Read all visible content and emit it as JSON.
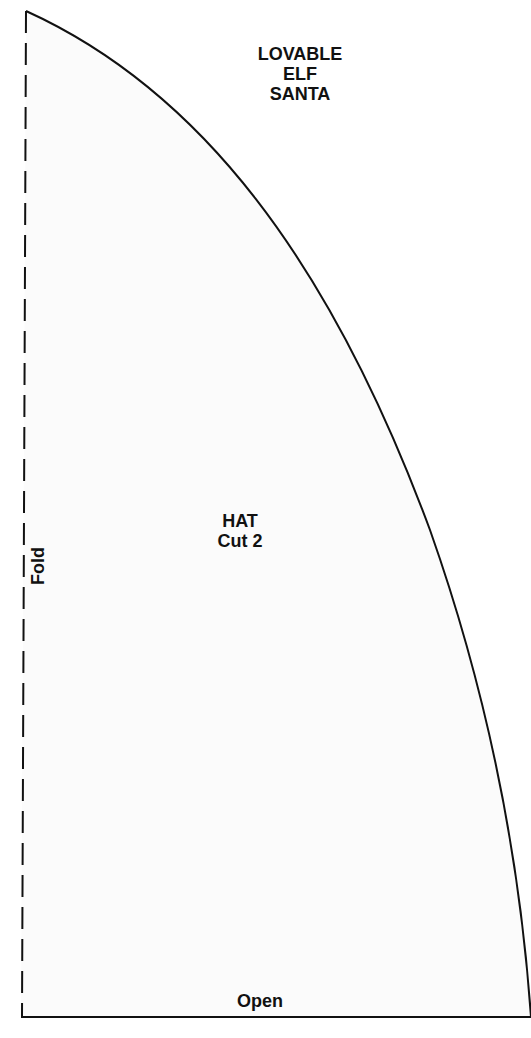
{
  "pattern": {
    "title_lines": [
      "LOVABLE",
      "ELF",
      "SANTA"
    ],
    "piece": {
      "name": "HAT",
      "instruction": "Cut 2"
    },
    "edges": {
      "fold_label": "Fold",
      "open_label": "Open"
    },
    "colors": {
      "background": "#ffffff",
      "piece_fill": "#fbfbfb",
      "outline": "#111111"
    }
  }
}
